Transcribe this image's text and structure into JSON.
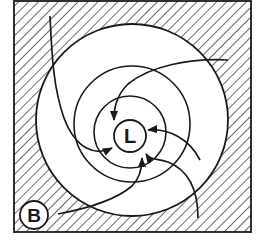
{
  "diagram": {
    "title": "",
    "colors": {
      "ink": "#1a1a1a",
      "background": "#ffffff"
    },
    "frame": {
      "x": 14,
      "y": 1,
      "width": 237,
      "height": 231,
      "fill": "hatched"
    },
    "circles": [
      {
        "name": "outer-circle",
        "cx": 132,
        "cy": 120,
        "r": 96
      },
      {
        "name": "middle-circle",
        "cx": 132,
        "cy": 124,
        "r": 58
      },
      {
        "name": "inner-circle",
        "cx": 130,
        "cy": 132,
        "r": 36
      }
    ],
    "center_node": {
      "label": "L",
      "cx": 130,
      "cy": 136,
      "r": 16
    },
    "source_node": {
      "label": "B",
      "cx": 34,
      "cy": 215,
      "r": 14
    },
    "flow_lines": [
      {
        "name": "flow-from-top-left",
        "arrow": "at-L-left"
      },
      {
        "name": "flow-from-top-right",
        "arrow": "at-L-top"
      },
      {
        "name": "flow-from-right",
        "arrow": "at-L-right"
      },
      {
        "name": "flow-from-bottom-right",
        "arrow": "at-L-bottom"
      },
      {
        "name": "flow-from-B",
        "arrow": "at-L-bottom-left"
      }
    ]
  }
}
